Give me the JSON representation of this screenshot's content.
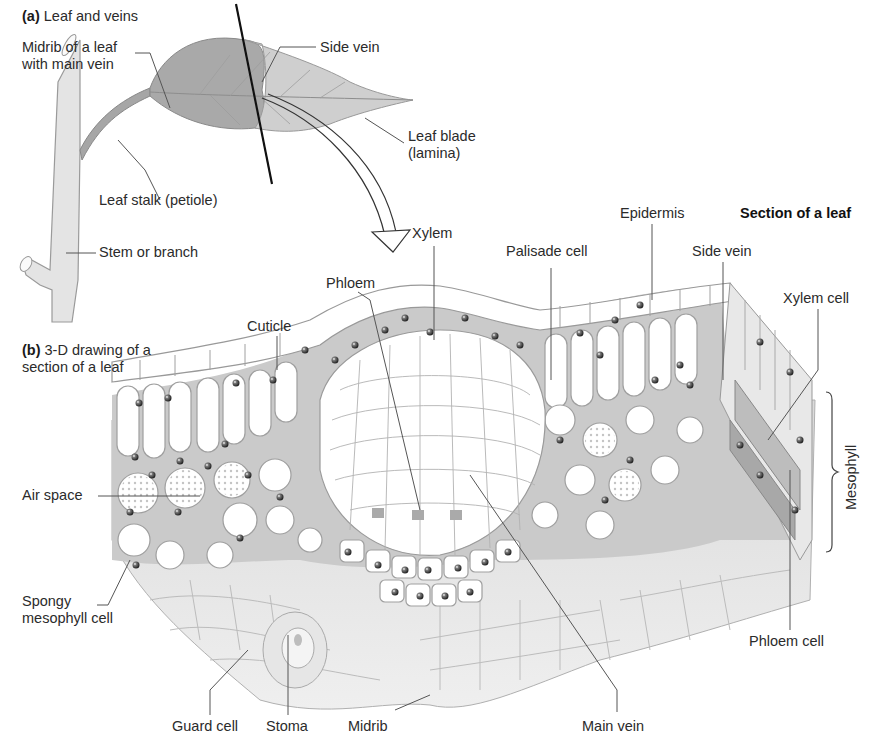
{
  "diagram": {
    "part_a": {
      "letter": "(a)",
      "heading": "Leaf and veins",
      "labels": {
        "midrib_line1": "Midrib of a leaf",
        "midrib_line2": "with main vein",
        "side_vein": "Side vein",
        "leaf_blade_line1": "Leaf blade",
        "leaf_blade_line2": "(lamina)",
        "leaf_stalk": "Leaf stalk (petiole)",
        "stem": "Stem or branch"
      }
    },
    "part_b": {
      "letter": "(b)",
      "heading_line1": "3-D drawing of a",
      "heading_line2": "section of a leaf",
      "section_title": "Section of a leaf",
      "labels": {
        "xylem": "Xylem",
        "epidermis": "Epidermis",
        "palisade_cell": "Palisade cell",
        "side_vein": "Side vein",
        "xylem_cell": "Xylem cell",
        "phloem": "Phloem",
        "cuticle": "Cuticle",
        "air_space": "Air space",
        "spongy_line1": "Spongy",
        "spongy_line2": "mesophyll cell",
        "mesophyll": "Mesophyll",
        "phloem_cell": "Phloem cell",
        "guard_cell": "Guard cell",
        "stoma": "Stoma",
        "midrib": "Midrib",
        "main_vein": "Main vein"
      }
    },
    "colors": {
      "leaf_fill": "#a9a9a9",
      "leaf_light": "#d6d6d6",
      "stem_fill": "#e6e6e6",
      "cell_outline": "#9a9a9a",
      "cell_fill": "#ffffff",
      "tissue_gray": "#c8c8c8",
      "lower_gray": "#e2e2e2",
      "nucleus": "#3a3a3a",
      "leader_line": "#555555",
      "text": "#2b2b2b"
    }
  }
}
